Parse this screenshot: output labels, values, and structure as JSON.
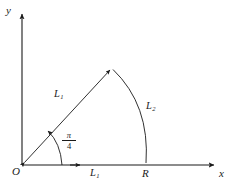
{
  "figure": {
    "type": "geometry-diagram",
    "background_color": "#ffffff",
    "stroke_color": "#1a1a1a",
    "axes": {
      "origin_label": "O",
      "x_label": "x",
      "y_label": "y",
      "origin_px": [
        22,
        165
      ],
      "x_axis_end_px": [
        215,
        165
      ],
      "y_axis_top_px": [
        22,
        12
      ]
    },
    "labels": {
      "ray_length": "L",
      "ray_length_sub": "1",
      "arc_length": "L",
      "arc_length_sub": "2",
      "axis_segment": "L",
      "axis_segment_sub": "1",
      "radius_point": "R",
      "angle_numerator": "π",
      "angle_denominator": "4"
    },
    "geometry": {
      "ray_angle_radians": "π/4",
      "apex_px": [
        112,
        68
      ],
      "arc_foot_px": [
        146,
        165
      ],
      "angle_arc_radius_px": 40
    }
  }
}
